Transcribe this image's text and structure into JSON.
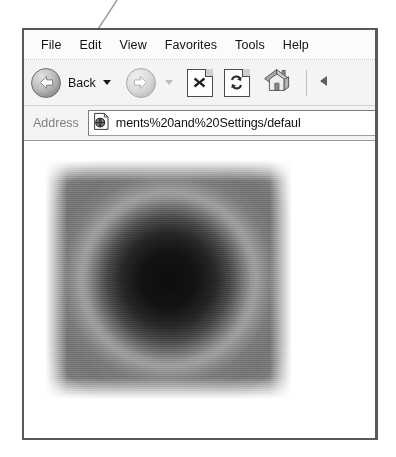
{
  "window": {
    "menu": {
      "items": [
        {
          "label": "File",
          "name": "menu-item-file"
        },
        {
          "label": "Edit",
          "name": "menu-item-edit"
        },
        {
          "label": "View",
          "name": "menu-item-view"
        },
        {
          "label": "Favorites",
          "name": "menu-item-favorites"
        },
        {
          "label": "Tools",
          "name": "menu-item-tools"
        },
        {
          "label": "Help",
          "name": "menu-item-help"
        }
      ]
    },
    "toolbar": {
      "back_label": "Back",
      "icons": [
        "back-arrow-icon",
        "back-dropdown-caret-icon",
        "forward-arrow-icon",
        "forward-dropdown-caret-icon",
        "stop-icon",
        "refresh-icon",
        "home-icon"
      ]
    },
    "address": {
      "label": "Address",
      "value": "ments%20and%20Settings/defaul",
      "favicon": "page-globe-icon"
    },
    "content": {
      "image_name": "grayscale-radial-gradient-image",
      "description": "Grayscale radial gradient: near-black center, light gray ring, medium gray field fading to white at the square edges"
    }
  },
  "annotation": {
    "name": "leader-line",
    "color": "#9a9a9a"
  },
  "colors": {
    "window_border": "#55595c",
    "toolbar_bg": "#f4f4f4",
    "menu_bg": "#fbfbfb",
    "address_label": "#818181",
    "gradient_center": "#0d0d0d",
    "gradient_ring": "#9e9e9e",
    "gradient_field": "#767676"
  }
}
